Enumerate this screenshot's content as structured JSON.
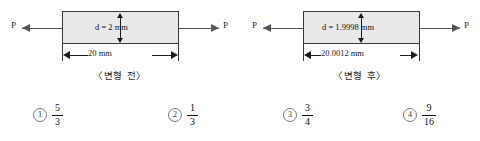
{
  "figures": [
    {
      "id": "before",
      "force_label_left": "P",
      "force_label_right": "P",
      "diameter_label": "d = 2 mm",
      "length_label": "20 mm",
      "caption": "〈변형 전〉"
    },
    {
      "id": "after",
      "force_label_left": "P",
      "force_label_right": "P",
      "diameter_label": "d = 1.9998 mm",
      "length_label": "20.0012 mm",
      "caption": "〈변형 후〉"
    }
  ],
  "choices": [
    {
      "number": "1",
      "numerator": "5",
      "denominator": "3"
    },
    {
      "number": "2",
      "numerator": "1",
      "denominator": "3"
    },
    {
      "number": "3",
      "numerator": "3",
      "denominator": "4"
    },
    {
      "number": "4",
      "numerator": "9",
      "denominator": "16"
    }
  ],
  "colors": {
    "bar_fill": "#e9e9e9",
    "bar_stroke": "#3a3a3a",
    "arrow": "#555555",
    "dimension": "#1c1c1c",
    "text": "#111111",
    "background": "#ffffff"
  }
}
